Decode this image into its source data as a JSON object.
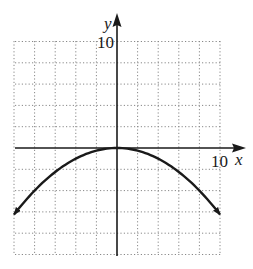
{
  "chart_data": {
    "type": "line",
    "title": "",
    "xlabel": "x",
    "ylabel": "y",
    "xlim": [
      -10,
      10
    ],
    "ylim": [
      -10,
      10
    ],
    "grid": true,
    "grid_style": "dotted",
    "grid_step": 2,
    "tick_labels": {
      "x": "10",
      "y": "10"
    },
    "series": [
      {
        "name": "parabola",
        "equation": "y = -0.0625x^2",
        "x": [
          -10,
          -8,
          -6,
          -4,
          -2,
          0,
          2,
          4,
          6,
          8,
          10
        ],
        "y": [
          -6.25,
          -4,
          -2.25,
          -1,
          -0.25,
          0,
          -0.25,
          -1,
          -2.25,
          -4,
          -6.25
        ],
        "arrows_at_ends": true
      }
    ],
    "legend": null
  },
  "labels": {
    "x_axis": "x",
    "y_axis": "y",
    "x_tick": "10",
    "y_tick": "10"
  },
  "colors": {
    "axis": "#1a1a1a",
    "curve": "#1a1a1a",
    "grid": "#888888"
  }
}
